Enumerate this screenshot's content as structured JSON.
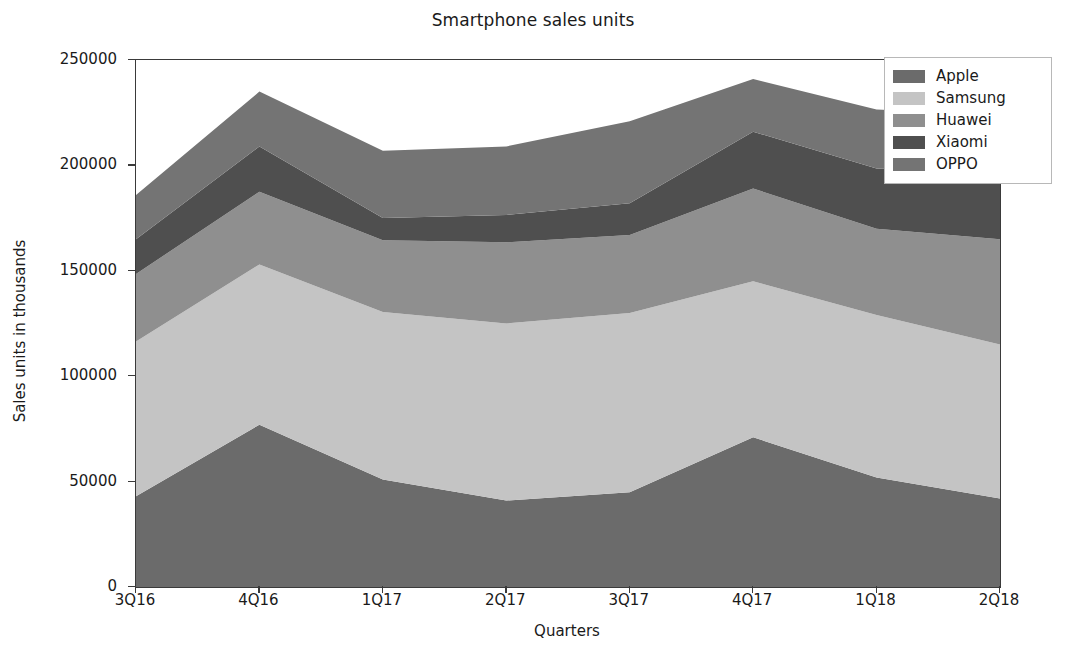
{
  "chart_data": {
    "type": "area",
    "stacked": true,
    "title": "Smartphone sales units",
    "xlabel": "Quarters",
    "ylabel": "Sales units in thousands",
    "categories": [
      "3Q16",
      "4Q16",
      "1Q17",
      "2Q17",
      "3Q17",
      "4Q17",
      "1Q18",
      "2Q18"
    ],
    "x_ticks": [
      "3Q16",
      "4Q16",
      "1Q17",
      "2Q17",
      "3Q17",
      "4Q17",
      "1Q18",
      "2Q18"
    ],
    "y_ticks": [
      "0",
      "50000",
      "100000",
      "150000",
      "200000",
      "250000"
    ],
    "y_tick_values": [
      0,
      50000,
      100000,
      150000,
      200000,
      250000
    ],
    "ylim": [
      0,
      250000
    ],
    "grid": false,
    "legend_position": "upper right",
    "series": [
      {
        "name": "Apple",
        "color": "#6b6b6b",
        "values": [
          43000,
          77000,
          51000,
          41000,
          45000,
          71000,
          52000,
          42000
        ]
      },
      {
        "name": "Samsung",
        "color": "#c4c4c4",
        "values": [
          73500,
          76000,
          79500,
          84000,
          85000,
          74000,
          77000,
          73000
        ]
      },
      {
        "name": "Huawei",
        "color": "#8f8f8f",
        "values": [
          32000,
          34500,
          34000,
          38500,
          37000,
          44000,
          41000,
          50000
        ]
      },
      {
        "name": "Xiaomi",
        "color": "#4f4f4f",
        "values": [
          16500,
          21500,
          10500,
          13000,
          15000,
          27000,
          28500,
          31000
        ]
      },
      {
        "name": "OPPO",
        "color": "#747474",
        "values": [
          21000,
          26000,
          32000,
          32500,
          39000,
          25000,
          28000,
          28000
        ]
      }
    ],
    "stack_tops": {
      "Apple": [
        43000,
        77000,
        51000,
        41000,
        45000,
        71000,
        52000,
        42000
      ],
      "Samsung": [
        116500,
        153000,
        130500,
        125000,
        130000,
        145000,
        129000,
        115000
      ],
      "Huawei": [
        148500,
        187500,
        164500,
        163500,
        167000,
        189000,
        170000,
        165000
      ],
      "Xiaomi": [
        165000,
        209000,
        175000,
        176500,
        182000,
        216000,
        198500,
        196000
      ],
      "OPPO": [
        186000,
        235000,
        207000,
        209000,
        221000,
        241000,
        226500,
        224000
      ]
    }
  },
  "legend": {
    "items": [
      {
        "label": "Apple"
      },
      {
        "label": "Samsung"
      },
      {
        "label": "Huawei"
      },
      {
        "label": "Xiaomi"
      },
      {
        "label": "OPPO"
      }
    ]
  }
}
